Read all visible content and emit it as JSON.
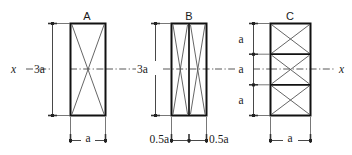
{
  "figure": {
    "background_color": "#ffffff",
    "line_color": "#111111",
    "hatch_color": "#555555",
    "dimension_color": "#333333",
    "axis_label_left": "x",
    "axis_label_right": "x"
  },
  "sections": [
    {
      "id": "A",
      "label": "A",
      "height_label": "3a",
      "width_labels": [
        "a"
      ],
      "panels": 1,
      "cells": 1,
      "description": "single tall rectangle with crossed diagonals"
    },
    {
      "id": "B",
      "label": "B",
      "height_label": "3a",
      "width_labels": [
        "0.5a",
        "0.5a"
      ],
      "panels": 2,
      "cells": 1,
      "description": "two narrow tall rectangles side by side, each with crossed diagonals"
    },
    {
      "id": "C",
      "label": "C",
      "height_label": "",
      "height_segment_labels": [
        "a",
        "a",
        "a"
      ],
      "width_labels": [
        "a"
      ],
      "panels": 1,
      "cells": 3,
      "description": "tall rectangle split into three stacked square cells, each with crossed diagonals"
    }
  ],
  "annotations": {
    "a_label": "a",
    "three_a_label": "3a",
    "half_a_label": "0.5a",
    "x_axis_label": "x"
  }
}
